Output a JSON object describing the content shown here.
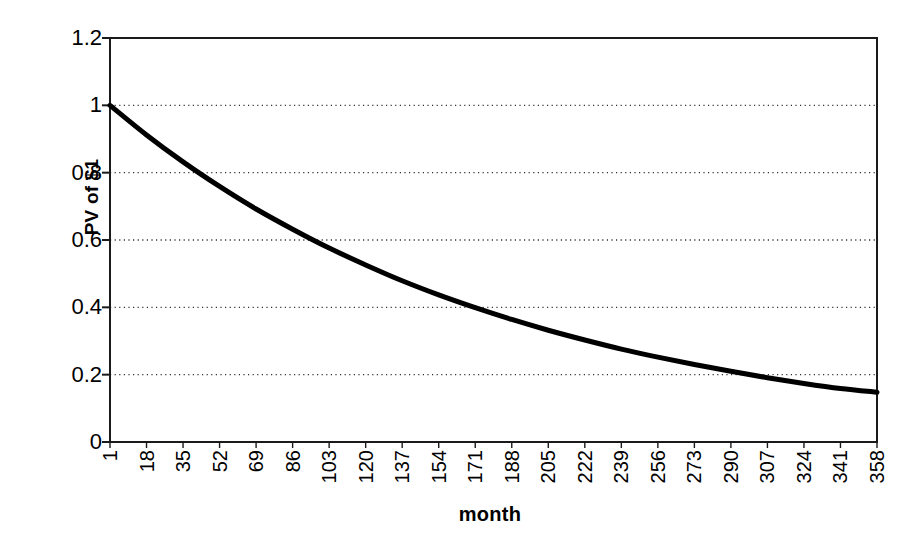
{
  "chart_data": {
    "type": "line",
    "title": "",
    "xlabel": "month",
    "ylabel": "PV of $1",
    "xlim": [
      1,
      358
    ],
    "ylim": [
      0,
      1.2
    ],
    "grid": true,
    "grid_axis": "y",
    "legend": "none",
    "line_color": "#000000",
    "y_ticks": [
      "1.2",
      "1",
      "0.8",
      "0.6",
      "0.4",
      "0.2",
      "0"
    ],
    "y_tick_values": [
      1.2,
      1,
      0.8,
      0.6,
      0.4,
      0.2,
      0
    ],
    "categories": [
      "1",
      "18",
      "35",
      "52",
      "69",
      "86",
      "103",
      "120",
      "137",
      "154",
      "171",
      "188",
      "205",
      "222",
      "239",
      "256",
      "273",
      "290",
      "307",
      "324",
      "341",
      "358"
    ],
    "x": [
      1,
      18,
      35,
      52,
      69,
      86,
      103,
      120,
      137,
      154,
      171,
      188,
      205,
      222,
      239,
      256,
      273,
      290,
      307,
      324,
      341,
      358
    ],
    "series": [
      {
        "name": "PV of $1",
        "values": [
          1.0,
          0.912,
          0.832,
          0.759,
          0.692,
          0.632,
          0.576,
          0.526,
          0.479,
          0.437,
          0.399,
          0.364,
          0.332,
          0.303,
          0.276,
          0.252,
          0.23,
          0.21,
          0.191,
          0.174,
          0.159,
          0.148
        ]
      }
    ],
    "annotations": []
  },
  "axes": {
    "y_title": "PV of $1",
    "x_title": "month"
  }
}
